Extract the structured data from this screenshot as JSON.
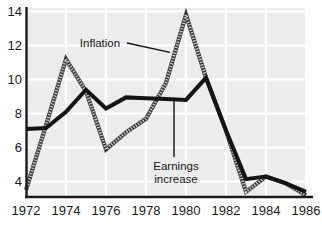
{
  "chart_data": {
    "type": "line",
    "title": "",
    "subtitle": "",
    "xlabel": "",
    "ylabel": "",
    "x": [
      1972,
      1973,
      1974,
      1975,
      1976,
      1977,
      1978,
      1979,
      1980,
      1981,
      1982,
      1983,
      1984,
      1985,
      1986
    ],
    "xlim": [
      1972,
      1986
    ],
    "ylim": [
      3.1,
      14.2
    ],
    "xticks": [
      1972,
      1974,
      1976,
      1978,
      1980,
      1982,
      1984,
      1986
    ],
    "xtick_labels": [
      "1972",
      "1974",
      "1976",
      "1978",
      "1980",
      "1982",
      "1984",
      "1986"
    ],
    "yticks": [
      4,
      6,
      8,
      10,
      12,
      14
    ],
    "ytick_labels": [
      "4",
      "6",
      "8",
      "10",
      "12",
      "14"
    ],
    "grid": true,
    "grid_color": "#ffffff",
    "plot_background": "#ececec",
    "legend": "none",
    "series": [
      {
        "name": "Inflation",
        "style": "hatched",
        "color": "#4a4a4a",
        "values": [
          3.5,
          7.3,
          11.2,
          9.3,
          5.9,
          6.9,
          7.7,
          9.8,
          13.8,
          10.1,
          7.0,
          3.4,
          4.3,
          3.9,
          3.2
        ]
      },
      {
        "name": "Earnings increase",
        "style": "solid",
        "color": "#141414",
        "values": [
          7.1,
          7.15,
          8.1,
          9.4,
          8.3,
          8.95,
          8.9,
          8.85,
          8.8,
          10.1,
          7.0,
          4.15,
          4.3,
          3.9,
          3.4
        ]
      }
    ],
    "annotations": [
      {
        "name": "inflation",
        "text": "Inflation",
        "lines": [
          "Inflation"
        ],
        "leader": "horizontal",
        "points_to_year": 1979.2,
        "points_to_value": 11.6
      },
      {
        "name": "earnings-increase",
        "text": "Earnings increase",
        "lines": [
          "Earnings",
          "increase"
        ],
        "leader": "vertical",
        "points_to_year": 1979.4,
        "points_to_value": 8.85
      }
    ]
  }
}
